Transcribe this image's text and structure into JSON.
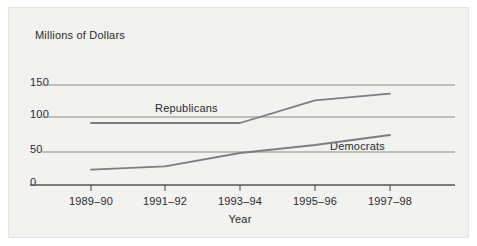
{
  "chart": {
    "title": "Millions of Dollars",
    "xaxis_title": "Year",
    "ytick_labels": [
      "150",
      "100",
      "50",
      "0"
    ],
    "xtick_labels": [
      "1989–90",
      "1991–92",
      "1993–94",
      "1995–96",
      "1997–98"
    ],
    "series_labels": {
      "republicans": "Republicans",
      "democrats": "Democrats"
    },
    "colors": {
      "line": "#7d7d7d",
      "axis": "#555555",
      "grid": "#8a8a8a",
      "text": "#2b2b2b",
      "panel": "#f2f2f0"
    }
  },
  "chart_data": {
    "type": "line",
    "title": "Millions of Dollars",
    "xlabel": "Year",
    "ylabel": "Millions of Dollars",
    "categories": [
      "1989–90",
      "1991–92",
      "1993–94",
      "1995–96",
      "1997–98"
    ],
    "series": [
      {
        "name": "Republicans",
        "values": [
          93,
          93,
          93,
          127,
          137
        ]
      },
      {
        "name": "Democrats",
        "values": [
          23,
          28,
          48,
          60,
          75
        ]
      }
    ],
    "ylim": [
      0,
      150
    ],
    "yticks": [
      0,
      50,
      100,
      150
    ],
    "grid": true,
    "legend": "inline-series-labels",
    "annotations": [
      {
        "text": "Republicans",
        "series": "Republicans"
      },
      {
        "text": "Democrats",
        "series": "Democrats"
      }
    ]
  }
}
